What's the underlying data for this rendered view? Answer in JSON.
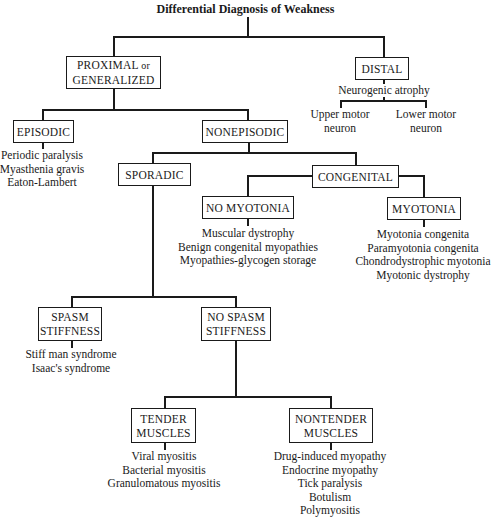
{
  "title": "Differential Diagnosis of Weakness",
  "nodes": {
    "proximal": {
      "line1": "PROXIMAL",
      "line1_suffix": "or",
      "line2": "GENERALIZED"
    },
    "distal": {
      "label": "DISTAL",
      "note": "Neurogenic atrophy",
      "children": [
        {
          "line1": "Upper motor",
          "line2": "neuron"
        },
        {
          "line1": "Lower motor",
          "line2": "neuron"
        }
      ]
    },
    "episodic": {
      "label": "EPISODIC",
      "items": [
        "Periodic paralysis",
        "Myasthenia gravis",
        "Eaton-Lambert"
      ]
    },
    "nonepisodic": {
      "label": "NONEPISODIC"
    },
    "sporadic": {
      "label": "SPORADIC"
    },
    "congenital": {
      "label": "CONGENITAL"
    },
    "no_myotonia": {
      "label": "NO MYOTONIA",
      "items": [
        "Muscular dystrophy",
        "Benign congenital myopathies",
        "Myopathies-glycogen storage"
      ]
    },
    "myotonia": {
      "label": "MYOTONIA",
      "items": [
        "Myotonia congenita",
        "Paramyotonia congenita",
        "Chondrodystrophic myotonia",
        "Myotonic dystrophy"
      ]
    },
    "spasm": {
      "line1": "SPASM",
      "line2": "STIFFNESS",
      "items": [
        "Stiff man syndrome",
        "Isaac's syndrome"
      ]
    },
    "no_spasm": {
      "line1": "NO SPASM",
      "line2": "STIFFNESS"
    },
    "tender": {
      "line1": "TENDER",
      "line2": "MUSCLES",
      "items": [
        "Viral myositis",
        "Bacterial myositis",
        "Granulomatous myositis"
      ]
    },
    "nontender": {
      "line1": "NONTENDER",
      "line2": "MUSCLES",
      "items": [
        "Drug-induced myopathy",
        "Endocrine myopathy",
        "Tick paralysis",
        "Botulism",
        "Polymyositis"
      ]
    }
  }
}
